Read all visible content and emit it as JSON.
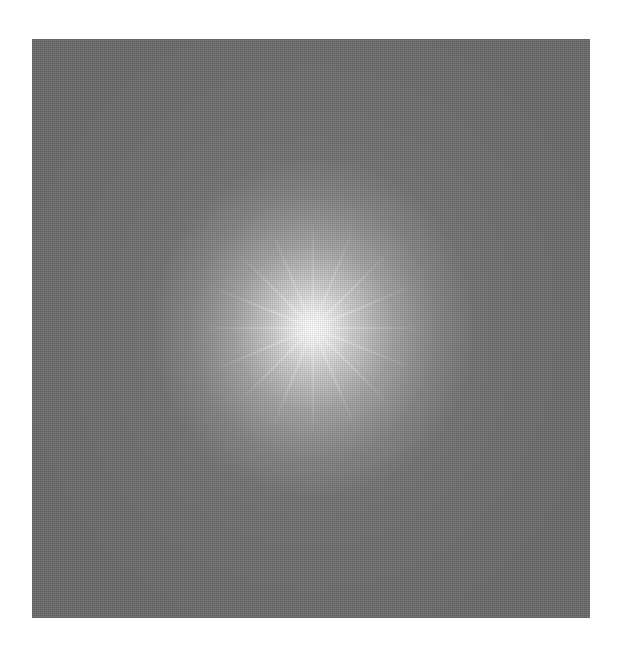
{
  "image": {
    "description": "Grayscale square with a bright radial starburst glow at the center fading to mid-gray at the edges",
    "colors": {
      "background": "#ffffff",
      "outer_gray": "#6e6e6e",
      "center": "#ffffff"
    },
    "ray_angles": [
      0,
      22,
      45,
      67,
      90,
      112,
      135,
      157
    ]
  }
}
